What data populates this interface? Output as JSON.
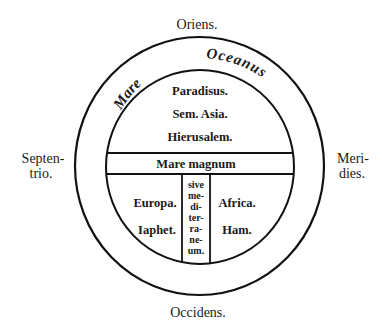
{
  "diagram": {
    "type": "T-O map",
    "cardinal_labels": {
      "top": "Oriens.",
      "bottom": "Occidens.",
      "left_line1": "Septen-",
      "left_line2": "trio.",
      "right_line1": "Meri-",
      "right_line2": "dies."
    },
    "ocean_ring": {
      "word1": "Mare",
      "word2": "Oceanus"
    },
    "asia_region": {
      "line1": "Paradisus.",
      "line2": "Sem. Asia.",
      "line3": "Hierusalem."
    },
    "sea_band": {
      "label": "Mare magnum"
    },
    "mediterranean_column": {
      "lines": [
        "sive",
        "me-",
        "di-",
        "ter-",
        "ra-",
        "ne-",
        "um."
      ]
    },
    "europe_region": {
      "line1": "Europa.",
      "line2": "Iaphet."
    },
    "africa_region": {
      "line1": "Africa.",
      "line2": "Ham."
    },
    "colors": {
      "ink": "#111111",
      "paper": "#ffffff"
    }
  }
}
